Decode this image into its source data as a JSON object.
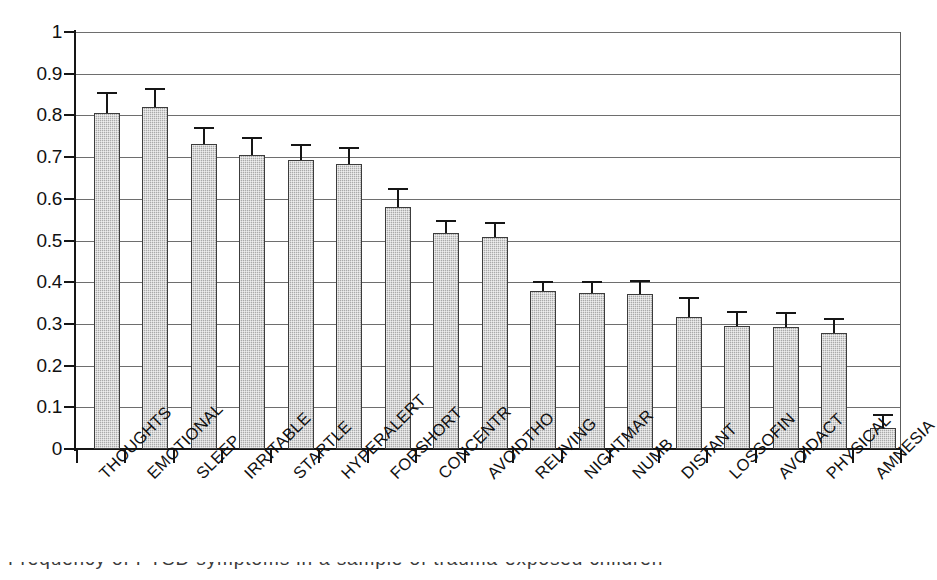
{
  "chart_data": {
    "type": "bar",
    "title": "",
    "xlabel": "",
    "ylabel": "",
    "ylim": [
      0,
      1
    ],
    "ytick_labels": [
      "1",
      "0.9",
      "0.8",
      "0.7",
      "0.6",
      "0.5",
      "0.4",
      "0.3",
      "0.2",
      "0.1",
      "0"
    ],
    "ytick_values": [
      1,
      0.9,
      0.8,
      0.7,
      0.6,
      0.5,
      0.4,
      0.3,
      0.2,
      0.1,
      0
    ],
    "grid": "horizontal",
    "legend": "none",
    "error_bars": "upper-only",
    "categories": [
      "THOUGHTS",
      "EMOTIONAL",
      "SLEEP",
      "IRRITABLE",
      "STARTLE",
      "HYPERALERT",
      "FORSHORT",
      "CONCENTR",
      "AVOIDTHO",
      "RELIVING",
      "NIGHTMAR",
      "NUMB",
      "DISTANT",
      "LOSSOFIN",
      "AVOIDACT",
      "PHYSICAL",
      "AMNESIA"
    ],
    "values": [
      0.805,
      0.82,
      0.731,
      0.705,
      0.693,
      0.683,
      0.58,
      0.518,
      0.508,
      0.378,
      0.373,
      0.372,
      0.317,
      0.296,
      0.292,
      0.278,
      0.051
    ],
    "error_upper": [
      0.05,
      0.046,
      0.042,
      0.043,
      0.039,
      0.042,
      0.045,
      0.03,
      0.037,
      0.026,
      0.03,
      0.033,
      0.048,
      0.036,
      0.036,
      0.037,
      0.033
    ],
    "bar_color": "#aaaaaa",
    "bar_edge_color": "#3c3c3c",
    "axis_color": "#161616",
    "grid_color": "#6e6e6e"
  },
  "caption": {
    "text": "Frequency of PTSD symptoms in a sample of trauma-exposed children"
  }
}
